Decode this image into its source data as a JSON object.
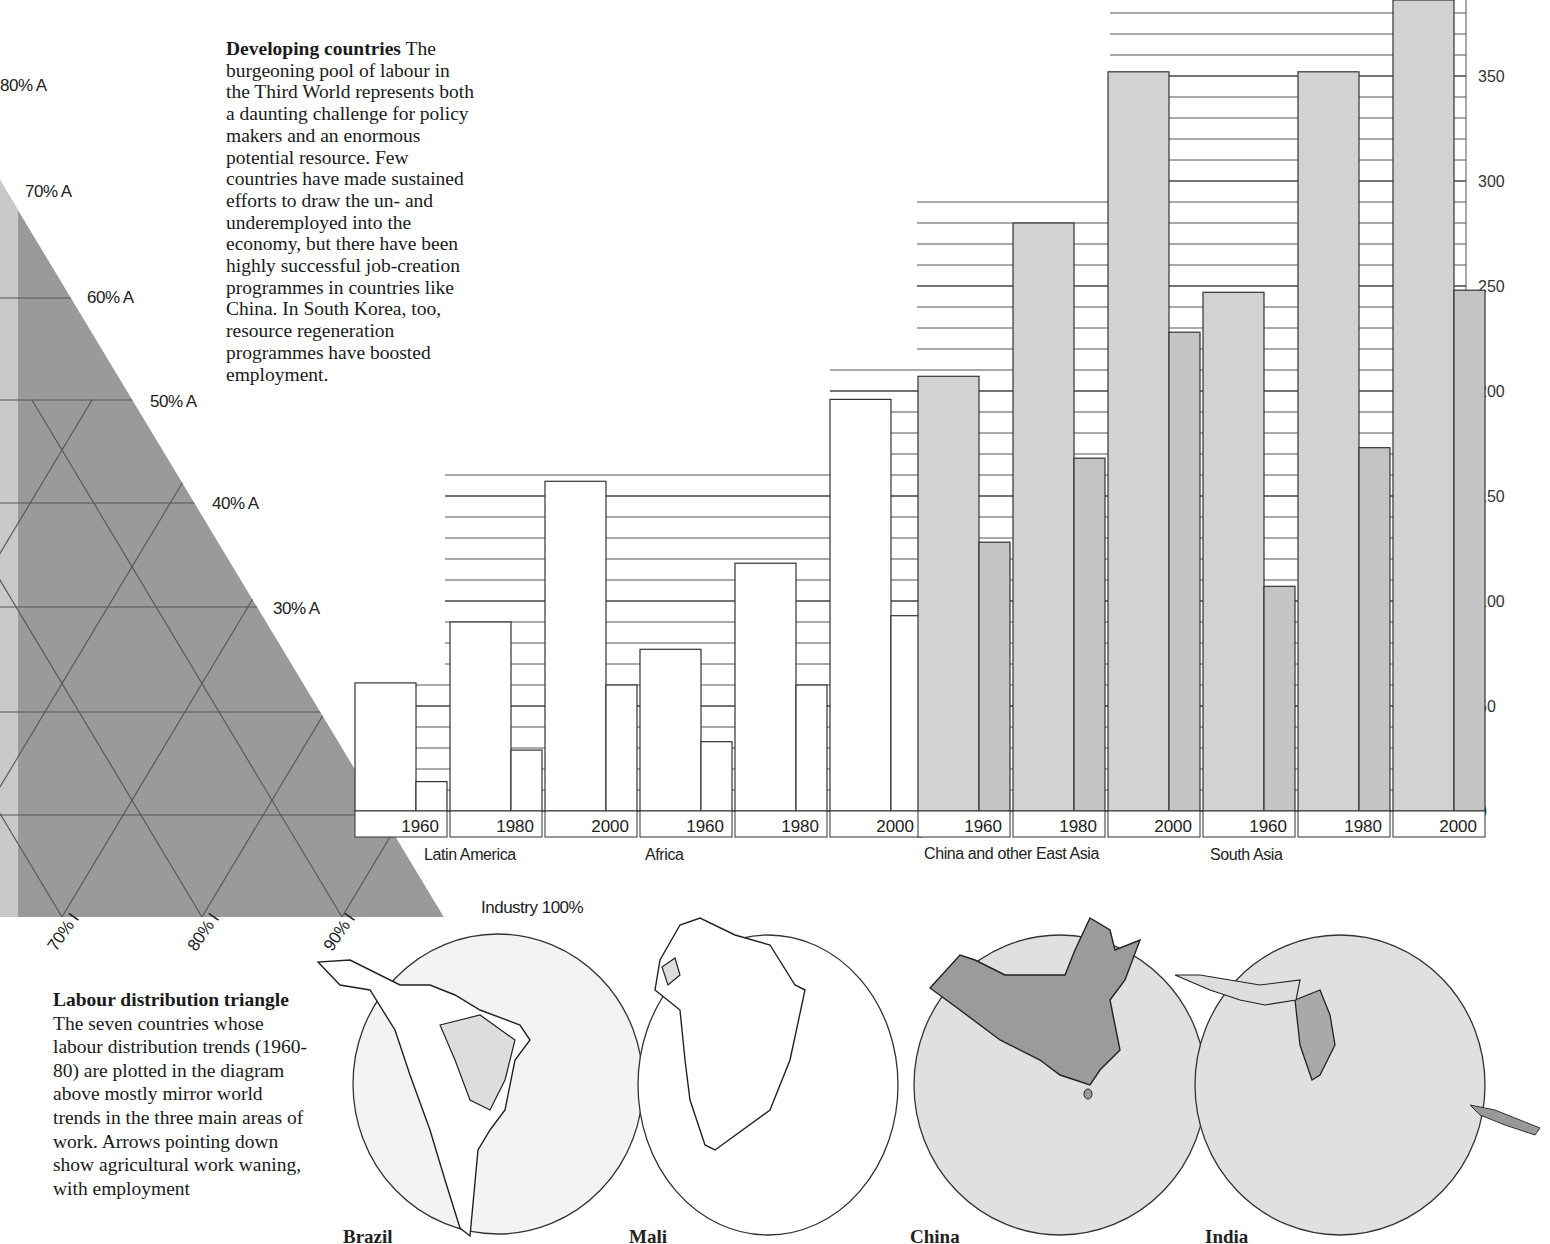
{
  "intro": {
    "heading": "Developing countries",
    "body": "The burgeoning pool of labour in the Third World represents both a daunting challenge for policy makers and an enormous potential resource. Few countries have made sustained efforts to draw the un- and underemployed into the economy, but there have been highly successful job-creation programmes in countries like China. In South Korea, too, resource regeneration programmes have boosted employment."
  },
  "triangle": {
    "agri_labels": [
      "80% A",
      "70% A",
      "60% A",
      "50% A",
      "40% A",
      "30% A"
    ],
    "industry_labels": [
      "70% I",
      "80% I",
      "90% I"
    ],
    "corner_label": "Industry 100%",
    "fill_color": "#9a9a9a"
  },
  "triangle_caption": {
    "title": "Labour distribution triangle",
    "body": "The seven countries whose labour distribution trends (1960-80) are plotted in the diagram above mostly mirror world trends in the three main areas of work. Arrows pointing down show agricultural work waning, with employment"
  },
  "maps": [
    {
      "label": "Brazil"
    },
    {
      "label": "Mali"
    },
    {
      "label": "China"
    },
    {
      "label": "India"
    }
  ],
  "chart_data": {
    "type": "bar",
    "title": "",
    "xlabel": "",
    "ylabel": "",
    "ylim": [
      0,
      380
    ],
    "y_ticks": [
      0,
      50,
      100,
      150,
      200,
      250,
      300,
      350
    ],
    "grid": true,
    "groups": [
      "Latin America",
      "Africa",
      "China and other East Asia",
      "South Asia"
    ],
    "years": [
      "1960",
      "1980",
      "2000"
    ],
    "series": [
      {
        "name": "Total (tall bar)",
        "values": {
          "Latin America": [
            61,
            90,
            157
          ],
          "Africa": [
            77,
            118,
            196
          ],
          "China and other East Asia": [
            207,
            280,
            352
          ],
          "South Asia": [
            247,
            352,
            390
          ]
        }
      },
      {
        "name": "Sub-total (short bar)",
        "values": {
          "Latin America": [
            14,
            29,
            60
          ],
          "Africa": [
            33,
            60,
            93
          ],
          "China and other East Asia": [
            128,
            168,
            228
          ],
          "South Asia": [
            107,
            173,
            248
          ]
        }
      }
    ],
    "colors": {
      "Latin America": "#ffffff",
      "Africa": "#ffffff",
      "China and other East Asia": "#d2d2d2",
      "South Asia": "#d2d2d2"
    }
  }
}
